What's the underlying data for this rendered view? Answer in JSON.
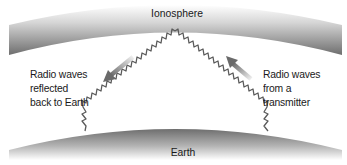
{
  "diagram": {
    "ionosphere": {
      "label": "Ionosphere"
    },
    "earth": {
      "label": "Earth"
    },
    "left_annotation": {
      "lines": [
        "Radio waves",
        "reflected",
        "back to Earth"
      ],
      "arrow_direction": "down-left"
    },
    "right_annotation": {
      "lines": [
        "Radio waves",
        "from a",
        "transmitter"
      ],
      "arrow_direction": "up-left"
    },
    "colors": {
      "band_dark": "#6e6e6e",
      "band_light": "#ffffff",
      "wave": "#5a5a5a",
      "arrow_dark": "#6a6a6a",
      "arrow_light": "#e6e6e6",
      "text": "#1a1a1a"
    }
  }
}
